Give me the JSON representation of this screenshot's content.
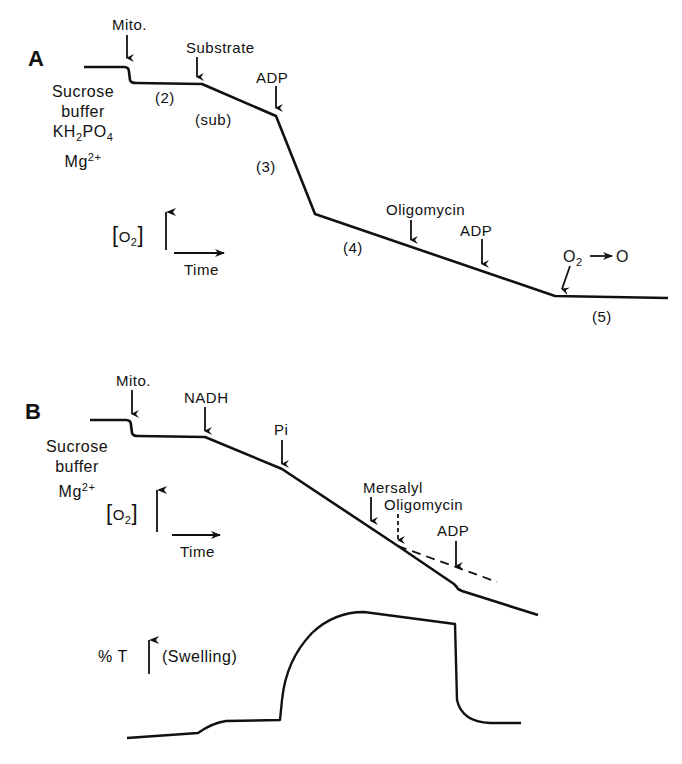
{
  "panel_a": {
    "label": "A",
    "conditions": [
      "Sucrose",
      "buffer",
      "KH",
      "2",
      "PO",
      "4",
      "Mg",
      "2+"
    ],
    "additions": {
      "mito": "Mito.",
      "substrate": "Substrate",
      "adp1": "ADP",
      "oligomycin": "Oligomycin",
      "adp2": "ADP",
      "o2_depletion_a": "O",
      "o2_depletion_sub": "2",
      "o2_depletion_b": "O"
    },
    "states": {
      "s2": "(2)",
      "sub": "(sub)",
      "s3": "(3)",
      "s4": "(4)",
      "s5": "(5)"
    },
    "axes": {
      "y_label": "O",
      "y_sub": "2",
      "x_label": "Time"
    }
  },
  "panel_b": {
    "label": "B",
    "conditions": [
      "Sucrose",
      "buffer",
      "Mg",
      "2+"
    ],
    "additions": {
      "mito": "Mito.",
      "nadh": "NADH",
      "pi": "Pi",
      "mersalyl": "Mersalyl",
      "oligomycin": "Oligomycin",
      "adp": "ADP"
    },
    "axes": {
      "y_label": "O",
      "y_sub": "2",
      "x_label": "Time"
    },
    "swelling": {
      "y_label": "% T",
      "note": "(Swelling)"
    }
  },
  "colors": {
    "ink": "#111111",
    "background": "#ffffff"
  }
}
